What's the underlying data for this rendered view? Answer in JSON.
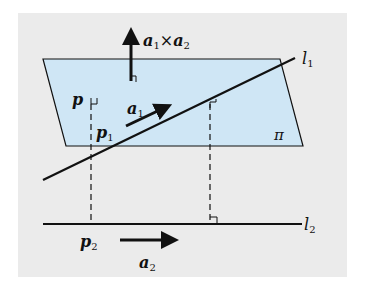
{
  "diagram": {
    "title": "",
    "colors": {
      "background": "#ebebeb",
      "plane_fill": "#cfe6f5",
      "stroke": "#111111"
    },
    "labels": {
      "normal_vector": {
        "base1": "a",
        "sub1": "1",
        "op": "×",
        "base2": "a",
        "sub2": "2"
      },
      "line1": {
        "base": "l",
        "sub": "1"
      },
      "line2": {
        "base": "l",
        "sub": "2"
      },
      "plane": "π",
      "point_p": "p",
      "point_p1": {
        "base": "p",
        "sub": "1"
      },
      "point_p2": {
        "base": "p",
        "sub": "2"
      },
      "dir_a1": {
        "base": "a",
        "sub": "1"
      },
      "dir_a2": {
        "base": "a",
        "sub": "2"
      }
    },
    "elements": [
      "plane π (parallelogram)",
      "line l1 crossing plane",
      "line l2 below plane",
      "normal vector a1 × a2 perpendicular to plane",
      "direction vector a1 along l1",
      "direction vector a2 along l2",
      "dashed perpendicular from p through p1 to p2",
      "dashed perpendicular from l1 to l2 with right-angle marks"
    ]
  }
}
